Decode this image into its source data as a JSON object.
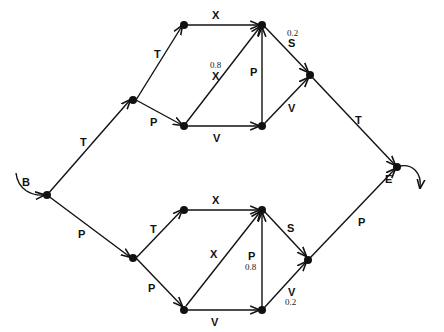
{
  "diagram": {
    "title": "",
    "start_label": "B",
    "end_label": "E",
    "nodes": [
      {
        "id": "B",
        "x": 47,
        "y": 195
      },
      {
        "id": "U1",
        "x": 133,
        "y": 128
      },
      {
        "id": "U2",
        "x": 184,
        "y": 76
      },
      {
        "id": "U3",
        "x": 262,
        "y": 76
      },
      {
        "id": "U4",
        "x": 184,
        "y": 126
      },
      {
        "id": "U5",
        "x": 262,
        "y": 126
      },
      {
        "id": "U6",
        "x": 308,
        "y": 76
      },
      {
        "id": "U7",
        "x": 308,
        "y": 126
      },
      {
        "id": "E",
        "x": 397,
        "y": 167
      }
    ],
    "edges": {
      "B_U1": {
        "label": "T"
      },
      "U1_U2": {
        "label": "T"
      },
      "U1_U4": {
        "label": "P"
      },
      "U2_U3": {
        "label": "X"
      },
      "U4_U3": {
        "label": "X",
        "prob": "0.8"
      },
      "U4_U5": {
        "label": "V"
      },
      "U5_U3": {
        "label": "P"
      },
      "U3_U6": {
        "label": "S",
        "prob": "0.2"
      },
      "U5_U6": {
        "label": "V"
      },
      "U6_E": {
        "label": "T"
      },
      "B_L1": {
        "label": "P"
      },
      "L1_L2": {
        "label": "T"
      },
      "L1_L4": {
        "label": "P"
      },
      "L2_L3": {
        "label": "X"
      },
      "L3_L4": {
        "label": "X"
      },
      "L4_L5": {
        "label": "V"
      },
      "L5_L3": {
        "label": "P",
        "prob": "0.8"
      },
      "L3_L6": {
        "label": "S"
      },
      "L5_L6": {
        "label": "V",
        "prob": "0.2"
      },
      "L6_E": {
        "label": "P"
      }
    }
  }
}
